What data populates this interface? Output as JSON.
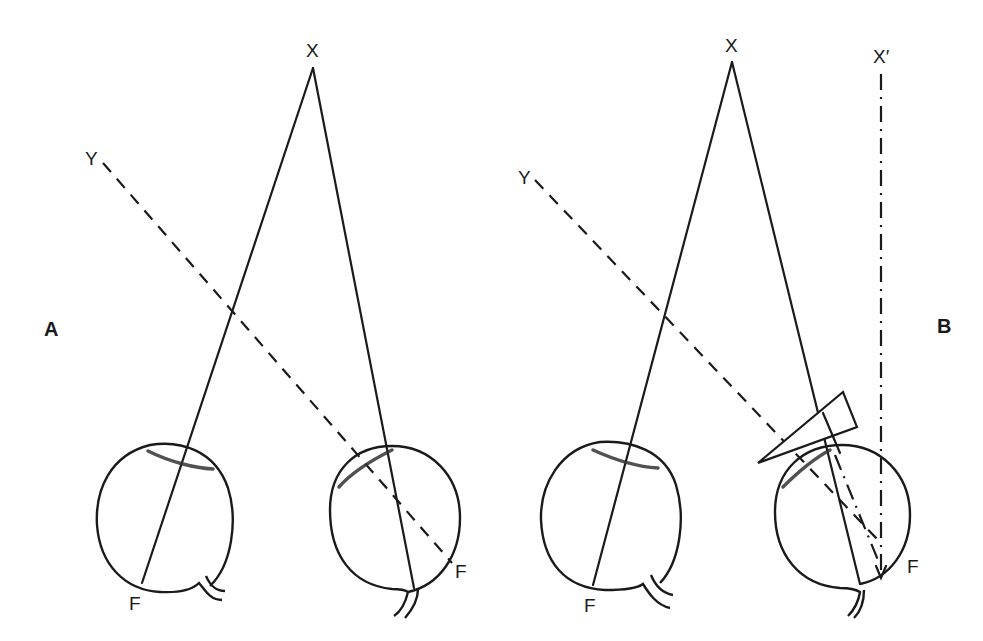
{
  "figure": {
    "panels": [
      {
        "id": "A",
        "label": "A",
        "target_label": "X",
        "secondary_target_label": "Y",
        "left_eye": {
          "fovea_label": "F"
        },
        "right_eye": {
          "fovea_label": "F"
        }
      },
      {
        "id": "B",
        "label": "B",
        "target_label": "X",
        "projected_target_label": "X′",
        "secondary_target_label": "Y",
        "left_eye": {
          "fovea_label": "F"
        },
        "right_eye": {
          "fovea_label": "F",
          "has_prism": true
        }
      }
    ],
    "line_styles": {
      "visual_axis": "solid",
      "deviated_eye_axis": "dashed",
      "prism_projection": "dash-dot"
    },
    "colors": {
      "ink": "#1a1a1a",
      "background": "#ffffff"
    }
  }
}
